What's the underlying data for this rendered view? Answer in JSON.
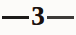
{
  "document": {
    "type": "scanned-page-folio",
    "paper_color": "#fcfbf9",
    "ink_color": "#19100d"
  },
  "page_marker": {
    "full_text": "—3—",
    "left_rule": "—",
    "number": "3",
    "right_rule": "—",
    "left_rule_name": "em-dash-rule",
    "right_rule_name": "em-dash-rule"
  }
}
